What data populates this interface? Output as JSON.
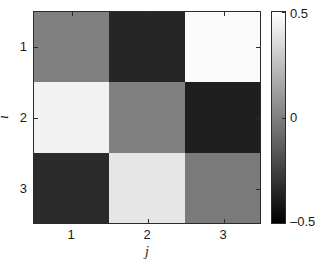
{
  "figure": {
    "type": "matrix-heatmap",
    "background": "#ffffff",
    "axis_color": "#2b2b2b"
  },
  "axes": {
    "xlabel": "j",
    "ylabel": "i",
    "xticklabels": [
      "1",
      "2",
      "3"
    ],
    "yticklabels": [
      "1",
      "2",
      "3"
    ]
  },
  "colorbar": {
    "ticklabels": [
      "0.5",
      "0",
      "–0.5"
    ],
    "top_color": "#ffffff",
    "bottom_color": "#000000",
    "orientation": "vertical"
  },
  "caption": {
    "text": "",
    "note": "cropped partial text row"
  },
  "chart_data": {
    "type": "heatmap",
    "title": "",
    "xlabel": "j",
    "ylabel": "i",
    "x": [
      1,
      2,
      3
    ],
    "y": [
      1,
      2,
      3
    ],
    "xticklabels": [
      "1",
      "2",
      "3"
    ],
    "yticklabels": [
      "1",
      "2",
      "3"
    ],
    "colormap": "gray",
    "clim": [
      -0.5,
      0.5
    ],
    "colorbar": {
      "ticks": [
        0.5,
        0,
        -0.5
      ],
      "ticklabels": [
        "0.5",
        "0",
        "–0.5"
      ],
      "position": "right"
    },
    "grid": false,
    "legend": null,
    "values": [
      [
        0.0,
        -0.42,
        0.48
      ],
      [
        0.45,
        0.0,
        -0.45
      ],
      [
        -0.4,
        0.4,
        -0.02
      ]
    ],
    "cell_colors": [
      [
        "#808080",
        "#262626",
        "#fbfbfb"
      ],
      [
        "#f2f2f2",
        "#808080",
        "#1f1f1f"
      ],
      [
        "#2b2b2b",
        "#e6e6e6",
        "#7a7a7a"
      ]
    ],
    "cell_labels": [
      [
        "i=1,j=1",
        "i=1,j=2",
        "i=1,j=3"
      ],
      [
        "i=2,j=1",
        "i=2,j=2",
        "i=2,j=3"
      ],
      [
        "i=3,j=1",
        "i=3,j=2",
        "i=3,j=3"
      ]
    ]
  }
}
